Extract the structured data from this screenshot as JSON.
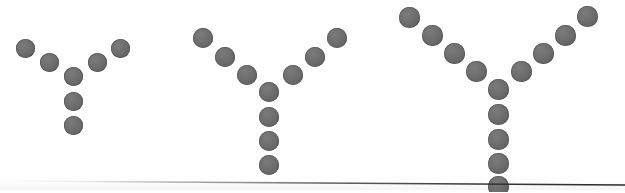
{
  "canvas": {
    "width": 625,
    "height": 192,
    "background_color": "#fefefe",
    "dot_color": "#6d6d6d",
    "dot_edge_color": "#4e4e4e",
    "baseline_color": "#3a3a3a",
    "description": "Three Y-shaped arrangements of gray circular dots of increasing size, above a faint horizontal rule"
  },
  "baseline": {
    "name": "horizontal-rule",
    "x_start": 95,
    "y_start": 180.5,
    "x_end": 625,
    "y_end": 184.5,
    "thickness": 1.6,
    "color": "#3a3a3a",
    "fades_in": true
  },
  "figures": [
    {
      "id": "figure-1",
      "label": "Y shape, small",
      "dot_count": 7,
      "dot_radius": 9.5,
      "arm_counts": {
        "left": 2,
        "right": 2,
        "stem": 2,
        "junction": 1
      },
      "dots": [
        {
          "name": "left-arm-outer",
          "cx": 25,
          "cy": 48,
          "r": 9.5
        },
        {
          "name": "left-arm-inner",
          "cx": 49,
          "cy": 62,
          "r": 9.5
        },
        {
          "name": "junction",
          "cx": 73,
          "cy": 76,
          "r": 9.5
        },
        {
          "name": "right-arm-inner",
          "cx": 97,
          "cy": 62,
          "r": 9.5
        },
        {
          "name": "right-arm-outer",
          "cx": 120,
          "cy": 48,
          "r": 9.5
        },
        {
          "name": "stem-1",
          "cx": 73,
          "cy": 101,
          "r": 9.5
        },
        {
          "name": "stem-2",
          "cx": 73,
          "cy": 125,
          "r": 9.5
        }
      ]
    },
    {
      "id": "figure-2",
      "label": "Y shape, medium",
      "dot_count": 10,
      "dot_radius": 10,
      "arm_counts": {
        "left": 3,
        "right": 3,
        "stem": 3,
        "junction": 1
      },
      "dots": [
        {
          "name": "left-arm-outer",
          "cx": 203,
          "cy": 38,
          "r": 10
        },
        {
          "name": "left-arm-mid",
          "cx": 225,
          "cy": 57,
          "r": 10
        },
        {
          "name": "left-arm-inner",
          "cx": 247,
          "cy": 75,
          "r": 10
        },
        {
          "name": "junction",
          "cx": 269,
          "cy": 92,
          "r": 10
        },
        {
          "name": "right-arm-inner",
          "cx": 293,
          "cy": 75,
          "r": 10
        },
        {
          "name": "right-arm-mid",
          "cx": 315,
          "cy": 57,
          "r": 10
        },
        {
          "name": "right-arm-outer",
          "cx": 337,
          "cy": 38,
          "r": 10
        },
        {
          "name": "stem-1",
          "cx": 269,
          "cy": 117,
          "r": 10
        },
        {
          "name": "stem-2",
          "cx": 269,
          "cy": 141,
          "r": 10
        },
        {
          "name": "stem-3",
          "cx": 269,
          "cy": 165,
          "r": 10
        }
      ]
    },
    {
      "id": "figure-3",
      "label": "Y shape, large",
      "dot_count": 13,
      "dot_radius": 10.5,
      "arm_counts": {
        "left": 4,
        "right": 4,
        "stem": 4,
        "junction": 1
      },
      "dots": [
        {
          "name": "left-arm-outer",
          "cx": 409,
          "cy": 17,
          "r": 10.5
        },
        {
          "name": "left-arm-upper-mid",
          "cx": 432,
          "cy": 35,
          "r": 10.5
        },
        {
          "name": "left-arm-lower-mid",
          "cx": 454,
          "cy": 53,
          "r": 10.5
        },
        {
          "name": "left-arm-inner",
          "cx": 476,
          "cy": 71,
          "r": 10.5
        },
        {
          "name": "junction",
          "cx": 498,
          "cy": 89,
          "r": 10.5
        },
        {
          "name": "right-arm-inner",
          "cx": 521,
          "cy": 71,
          "r": 10.5
        },
        {
          "name": "right-arm-lower-mid",
          "cx": 543,
          "cy": 53,
          "r": 10.5
        },
        {
          "name": "right-arm-upper-mid",
          "cx": 565,
          "cy": 35,
          "r": 10.5
        },
        {
          "name": "right-arm-outer",
          "cx": 587,
          "cy": 16,
          "r": 10.5
        },
        {
          "name": "stem-1",
          "cx": 498,
          "cy": 114,
          "r": 10.5
        },
        {
          "name": "stem-2",
          "cx": 498,
          "cy": 139,
          "r": 10.5
        },
        {
          "name": "stem-3",
          "cx": 498,
          "cy": 163,
          "r": 10.5
        },
        {
          "name": "stem-4",
          "cx": 498,
          "cy": 186,
          "r": 10.5
        }
      ]
    }
  ]
}
